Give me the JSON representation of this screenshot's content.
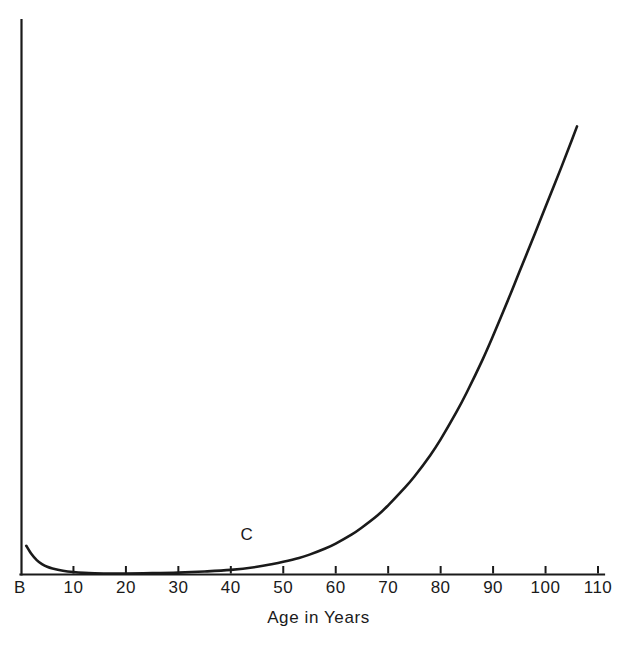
{
  "chart_data": {
    "type": "line",
    "title": "",
    "subtitle": "",
    "xlabel": "Age in Years",
    "ylabel": "",
    "xlim": [
      0,
      110
    ],
    "ylim": [
      0,
      100
    ],
    "grid": false,
    "legend": null,
    "origin_label": "B",
    "x_tick_labels": [
      "10",
      "20",
      "30",
      "40",
      "50",
      "60",
      "70",
      "80",
      "90",
      "100",
      "110"
    ],
    "x_ticks": [
      10,
      20,
      30,
      40,
      50,
      60,
      70,
      80,
      90,
      100,
      110
    ],
    "y_tick_labels": [],
    "annotations": [
      {
        "text": "C",
        "x": 43,
        "y": 7
      }
    ],
    "series": [
      {
        "name": "C",
        "line_color": "#1a1a1a",
        "line_width": 2.6,
        "x": [
          1,
          2,
          3,
          4,
          5,
          6,
          8,
          10,
          12,
          14,
          16,
          20,
          25,
          30,
          35,
          40,
          45,
          48,
          50,
          53,
          55,
          58,
          60,
          63,
          65,
          68,
          70,
          73,
          75,
          78,
          80,
          83,
          85,
          88,
          90,
          93,
          95,
          98,
          100,
          103,
          105,
          106
        ],
        "y": [
          5.1,
          3.6,
          2.5,
          1.8,
          1.3,
          1.0,
          0.6,
          0.35,
          0.2,
          0.12,
          0.1,
          0.1,
          0.15,
          0.25,
          0.45,
          0.75,
          1.3,
          1.8,
          2.2,
          2.9,
          3.5,
          4.6,
          5.5,
          7.1,
          8.4,
          10.6,
          12.4,
          15.4,
          17.6,
          21.4,
          24.3,
          29.2,
          32.8,
          38.7,
          43.0,
          49.8,
          54.5,
          61.5,
          66.3,
          73.4,
          78.3,
          80.8
        ]
      }
    ]
  },
  "colors": {
    "axis": "#1a1a1a",
    "curve": "#1a1a1a",
    "background": "#ffffff",
    "text": "#1a1a1a"
  },
  "geometry": {
    "plot_left": 21,
    "plot_right": 604,
    "plot_top": 20,
    "plot_bottom": 574,
    "x_px_per_year": 5.24,
    "tick_height": 8
  }
}
